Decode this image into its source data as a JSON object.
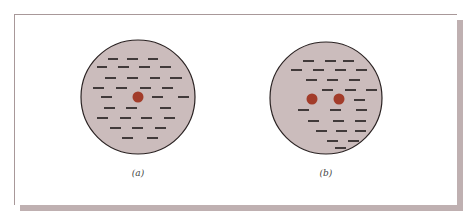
{
  "figure": {
    "panels": [
      {
        "id": "a",
        "label": "(a)",
        "circle": {
          "cx": 138,
          "cy": 97,
          "r": 57
        },
        "positive_charges": [
          {
            "cx": 138,
            "cy": 97
          }
        ],
        "negative_charges": [
          [
            108,
            59,
            118
          ],
          [
            127,
            59,
            138
          ],
          [
            148,
            59,
            158
          ],
          [
            97,
            67,
            107
          ],
          [
            118,
            67,
            129
          ],
          [
            139,
            67,
            150
          ],
          [
            160,
            67,
            171
          ],
          [
            105,
            78,
            116
          ],
          [
            127,
            78,
            138
          ],
          [
            150,
            78,
            160
          ],
          [
            170,
            78,
            182
          ],
          [
            93,
            88,
            104
          ],
          [
            116,
            88,
            127
          ],
          [
            140,
            88,
            151
          ],
          [
            162,
            88,
            173
          ],
          [
            101,
            97,
            112
          ],
          [
            152,
            97,
            163
          ],
          [
            178,
            97,
            189
          ],
          [
            104,
            108,
            115
          ],
          [
            126,
            108,
            137
          ],
          [
            160,
            108,
            171
          ],
          [
            97,
            118,
            108
          ],
          [
            120,
            118,
            131
          ],
          [
            141,
            118,
            152
          ],
          [
            164,
            118,
            175
          ],
          [
            110,
            128,
            121
          ],
          [
            132,
            128,
            143
          ],
          [
            155,
            128,
            166
          ],
          [
            122,
            138,
            133
          ],
          [
            147,
            138,
            158
          ]
        ]
      },
      {
        "id": "b",
        "label": "(b)",
        "circle": {
          "cx": 326,
          "cy": 98,
          "r": 56
        },
        "positive_charges": [
          {
            "cx": 312,
            "cy": 99
          },
          {
            "cx": 339,
            "cy": 99
          }
        ],
        "negative_charges": [
          [
            303,
            61,
            314
          ],
          [
            325,
            61,
            336
          ],
          [
            343,
            61,
            354
          ],
          [
            291,
            70,
            302
          ],
          [
            313,
            70,
            324
          ],
          [
            335,
            70,
            346
          ],
          [
            356,
            70,
            367
          ],
          [
            306,
            80,
            317
          ],
          [
            327,
            80,
            338
          ],
          [
            349,
            80,
            360
          ],
          [
            322,
            90,
            333
          ],
          [
            345,
            90,
            356
          ],
          [
            366,
            90,
            377
          ],
          [
            354,
            100,
            365
          ],
          [
            298,
            110,
            309
          ],
          [
            330,
            110,
            341
          ],
          [
            356,
            110,
            367
          ],
          [
            308,
            121,
            319
          ],
          [
            333,
            121,
            344
          ],
          [
            355,
            121,
            366
          ],
          [
            316,
            131,
            327
          ],
          [
            336,
            131,
            347
          ],
          [
            355,
            131,
            366
          ],
          [
            327,
            141,
            338
          ],
          [
            348,
            141,
            359
          ],
          [
            335,
            148,
            346
          ]
        ]
      }
    ],
    "labels": {
      "a": "(a)",
      "b": "(b)"
    },
    "colors": {
      "circle_fill": "#cbbcbc",
      "circle_stroke": "#2a2222",
      "positive_charge": "#a23c2a",
      "negative_charge": "#1e1a1a",
      "panel_shadow": "#bfb0b1"
    }
  }
}
